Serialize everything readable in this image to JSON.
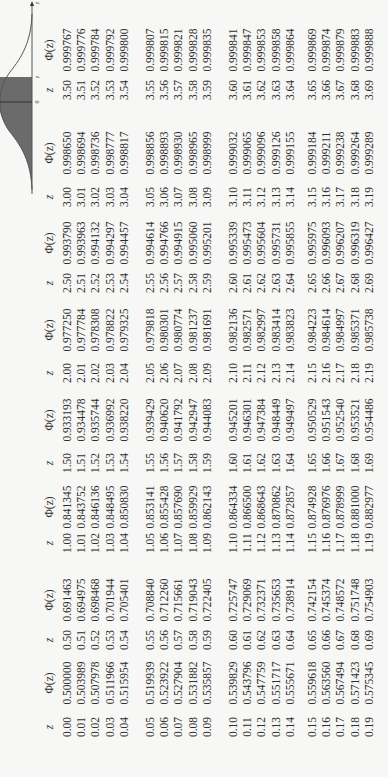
{
  "graph": {
    "axis_label": "z",
    "tick_zero": "0",
    "tick_z": "z",
    "shade_color": "#6b6b6b",
    "curve_color": "#555555"
  },
  "headers": {
    "z": "z",
    "phi": "Φ(z)"
  },
  "blocks": [
    {
      "z": [
        "0.00",
        "0.01",
        "0.02",
        "0.03",
        "0.04",
        "0.05",
        "0.06",
        "0.07",
        "0.08",
        "0.09",
        "0.10",
        "0.11",
        "0.12",
        "0.13",
        "0.14",
        "0.15",
        "0.16",
        "0.17",
        "0.18",
        "0.19"
      ],
      "phi": [
        "0.500000",
        "0.503989",
        "0.507978",
        "0.511966",
        "0.515954",
        "0.519939",
        "0.523922",
        "0.527904",
        "0.531882",
        "0.535857",
        "0.539829",
        "0.543796",
        "0.547759",
        "0.551717",
        "0.555671",
        "0.559618",
        "0.563560",
        "0.567494",
        "0.571423",
        "0.575345"
      ]
    },
    {
      "z": [
        "0.50",
        "0.51",
        "0.52",
        "0.53",
        "0.54",
        "0.55",
        "0.56",
        "0.57",
        "0.58",
        "0.59",
        "0.60",
        "0.61",
        "0.62",
        "0.63",
        "0.64",
        "0.65",
        "0.66",
        "0.67",
        "0.68",
        "0.69"
      ],
      "phi": [
        "0.691463",
        "0.694975",
        "0.698468",
        "0.701944",
        "0.705401",
        "0.708840",
        "0.712260",
        "0.715661",
        "0.719043",
        "0.722405",
        "0.725747",
        "0.729069",
        "0.732371",
        "0.735653",
        "0.738914",
        "0.742154",
        "0.745374",
        "0.748572",
        "0.751748",
        "0.754903"
      ]
    },
    {
      "z": [
        "1.00",
        "1.01",
        "1.02",
        "1.03",
        "1.04",
        "1.05",
        "1.06",
        "1.07",
        "1.08",
        "1.09",
        "1.10",
        "1.11",
        "1.12",
        "1.13",
        "1.14",
        "1.15",
        "1.16",
        "1.17",
        "1.18",
        "1.19"
      ],
      "phi": [
        "0.841345",
        "0.843752",
        "0.846136",
        "0.848495",
        "0.850830",
        "0.853141",
        "0.855428",
        "0.857690",
        "0.859929",
        "0.862143",
        "0.864334",
        "0.866500",
        "0.868643",
        "0.870862",
        "0.872857",
        "0.874928",
        "0.876976",
        "0.878999",
        "0.881000",
        "0.882977"
      ]
    },
    {
      "z": [
        "1.50",
        "1.51",
        "1.52",
        "1.53",
        "1.54",
        "1.55",
        "1.56",
        "1.57",
        "1.58",
        "1.59",
        "1.60",
        "1.61",
        "1.62",
        "1.63",
        "1.64",
        "1.65",
        "1.66",
        "1.67",
        "1.68",
        "1.69"
      ],
      "phi": [
        "0.933193",
        "0.934478",
        "0.935744",
        "0.936992",
        "0.938220",
        "0.939429",
        "0.940620",
        "0.941792",
        "0.942947",
        "0.944083",
        "0.945201",
        "0.946301",
        "0.947384",
        "0.948449",
        "0.949497",
        "0.950529",
        "0.951543",
        "0.952540",
        "0.953521",
        "0.954486"
      ]
    },
    {
      "z": [
        "2.00",
        "2.01",
        "2.02",
        "2.03",
        "2.04",
        "2.05",
        "2.06",
        "2.07",
        "2.08",
        "2.09",
        "2.10",
        "2.11",
        "2.12",
        "2.13",
        "2.14",
        "2.15",
        "2.16",
        "2.17",
        "2.18",
        "2.19"
      ],
      "phi": [
        "0.977250",
        "0.977784",
        "0.978308",
        "0.978822",
        "0.979325",
        "0.979818",
        "0.980301",
        "0.980774",
        "0.981237",
        "0.981691",
        "0.982136",
        "0.982571",
        "0.982997",
        "0.983414",
        "0.983823",
        "0.984223",
        "0.984614",
        "0.984997",
        "0.985371",
        "0.985738"
      ]
    },
    {
      "z": [
        "2.50",
        "2.51",
        "2.52",
        "2.53",
        "2.54",
        "2.55",
        "2.56",
        "2.57",
        "2.58",
        "2.59",
        "2.60",
        "2.61",
        "2.62",
        "2.63",
        "2.64",
        "2.65",
        "2.66",
        "2.67",
        "2.68",
        "2.69"
      ],
      "phi": [
        "0.993790",
        "0.993963",
        "0.994132",
        "0.994297",
        "0.994457",
        "0.994614",
        "0.994766",
        "0.994915",
        "0.995060",
        "0.995201",
        "0.995339",
        "0.995473",
        "0.995604",
        "0.995731",
        "0.995855",
        "0.995975",
        "0.996093",
        "0.996207",
        "0.996319",
        "0.996427"
      ]
    },
    {
      "z": [
        "3.00",
        "3.01",
        "3.02",
        "3.03",
        "3.04",
        "3.05",
        "3.06",
        "3.07",
        "3.08",
        "3.09",
        "3.10",
        "3.11",
        "3.12",
        "3.13",
        "3.14",
        "3.15",
        "3.16",
        "3.17",
        "3.18",
        "3.19"
      ],
      "phi": [
        "0.998650",
        "0.998694",
        "0.998736",
        "0.998777",
        "0.998817",
        "0.998856",
        "0.998893",
        "0.998930",
        "0.998965",
        "0.998999",
        "0.999032",
        "0.999065",
        "0.999096",
        "0.999126",
        "0.999155",
        "0.999184",
        "0.999211",
        "0.999238",
        "0.999264",
        "0.999289"
      ]
    },
    {
      "z": [
        "3.50",
        "3.51",
        "3.52",
        "3.53",
        "3.54",
        "3.55",
        "3.56",
        "3.57",
        "3.58",
        "3.59",
        "3.60",
        "3.61",
        "3.62",
        "3.63",
        "3.64",
        "3.65",
        "3.66",
        "3.67",
        "3.68",
        "3.69"
      ],
      "phi": [
        "0.999767",
        "0.999776",
        "0.999784",
        "0.999792",
        "0.999800",
        "0.999807",
        "0.999815",
        "0.999821",
        "0.999828",
        "0.999835",
        "0.999841",
        "0.999847",
        "0.999853",
        "0.999858",
        "0.999864",
        "0.999869",
        "0.999874",
        "0.999879",
        "0.999883",
        "0.999888"
      ]
    }
  ]
}
